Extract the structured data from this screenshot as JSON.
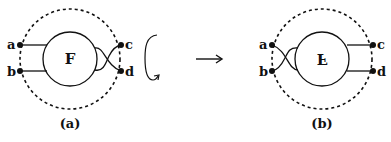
{
  "diagram": {
    "colors": {
      "stroke": "#111111",
      "background": "#ffffff"
    },
    "panel_a": {
      "caption": "(a)",
      "center_label": "F",
      "endpoints": {
        "a": "a",
        "b": "b",
        "c": "c",
        "d": "d"
      },
      "description": "Tangle F inside dashed circle; strands from a and b go straight into F; strands to c and d cross on the right."
    },
    "rotation_symbol": "rotation-arrow",
    "transition_arrow": "→",
    "panel_b": {
      "caption": "(b)",
      "center_label": "F",
      "center_label_transform": "flipped vertically",
      "endpoints": {
        "a": "a",
        "b": "b",
        "c": "c",
        "d": "d"
      },
      "description": "Rotated tangle (upside-down F); crossing now on the left between a and b; c and d straight."
    }
  }
}
